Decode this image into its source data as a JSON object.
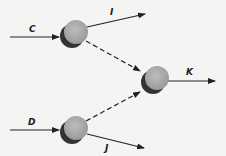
{
  "diagram": {
    "nodes": [
      {
        "id": "node-1",
        "cx": 75,
        "cy": 32,
        "r": 12
      },
      {
        "id": "node-2",
        "cx": 156,
        "cy": 79,
        "r": 12
      },
      {
        "id": "node-3",
        "cx": 75,
        "cy": 128,
        "r": 12
      }
    ],
    "edges": [
      {
        "label": "C",
        "from": "input",
        "to": "node-1",
        "style": "solid"
      },
      {
        "label": "I",
        "from": "node-1",
        "to": "output",
        "style": "solid"
      },
      {
        "label": "",
        "from": "node-1",
        "to": "node-2",
        "style": "dashed"
      },
      {
        "label": "K",
        "from": "node-2",
        "to": "output",
        "style": "solid"
      },
      {
        "label": "D",
        "from": "input",
        "to": "node-3",
        "style": "solid"
      },
      {
        "label": "",
        "from": "node-3",
        "to": "node-2",
        "style": "dashed"
      },
      {
        "label": "J",
        "from": "node-3",
        "to": "output",
        "style": "solid"
      }
    ],
    "labels": {
      "C": "C",
      "I": "I",
      "K": "K",
      "D": "D",
      "J": "J"
    },
    "colors": {
      "node_fill": "#a9a9a9",
      "node_shadow": "#3a3a3a",
      "line": "#222222",
      "background": "#f4f4f2"
    }
  }
}
